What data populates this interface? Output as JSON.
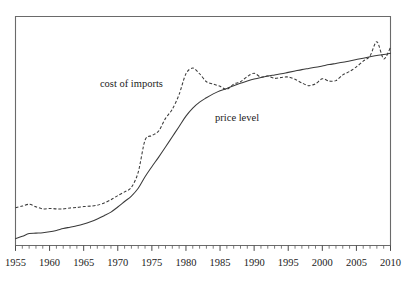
{
  "chart_data": {
    "type": "line",
    "title": "",
    "subtitle": "",
    "xlabel": "",
    "ylabel": "",
    "xlim": [
      1955,
      2010
    ],
    "ylim": [
      0,
      100
    ],
    "grid": false,
    "legend_position": "inline-annotations",
    "x_tick_labels": [
      "1955",
      "1960",
      "1965",
      "1970",
      "1975",
      "1980",
      "1985",
      "1990",
      "1995",
      "2000",
      "2005",
      "2010"
    ],
    "x_tick_values": [
      1955,
      1960,
      1965,
      1970,
      1975,
      1980,
      1985,
      1990,
      1995,
      2000,
      2005,
      2010
    ],
    "x_minor_tick_step": 1,
    "y_axis_visible": false,
    "y_tick_labels": [],
    "annotations": [
      {
        "text": "cost of imports",
        "x": 1972.0,
        "y": 69.0
      },
      {
        "text": "price level",
        "x": 1987.5,
        "y": 54.5
      }
    ],
    "series": [
      {
        "name": "cost of imports",
        "style": "dashed",
        "color": "#3a3a3a",
        "x": [
          1955,
          1956,
          1957,
          1958,
          1959,
          1960,
          1961,
          1962,
          1963,
          1964,
          1965,
          1966,
          1967,
          1968,
          1969,
          1970,
          1971,
          1972,
          1973,
          1974,
          1975,
          1976,
          1977,
          1978,
          1979,
          1980,
          1981,
          1982,
          1983,
          1984,
          1985,
          1986,
          1987,
          1988,
          1989,
          1990,
          1991,
          1992,
          1993,
          1994,
          1995,
          1996,
          1997,
          1998,
          1999,
          2000,
          2001,
          2002,
          2003,
          2004,
          2005,
          2006,
          2007,
          2008,
          2009,
          2010
        ],
        "y": [
          16.5,
          17.2,
          18.0,
          16.9,
          16.0,
          16.2,
          16.0,
          16.0,
          16.4,
          16.6,
          17.0,
          17.2,
          17.6,
          18.6,
          20.0,
          21.8,
          23.4,
          25.4,
          32.0,
          46.0,
          48.0,
          50.0,
          55.5,
          59.5,
          66.0,
          75.0,
          77.5,
          75.0,
          71.5,
          70.5,
          69.5,
          68.2,
          70.5,
          71.5,
          73.8,
          75.2,
          73.5,
          74.0,
          73.0,
          73.4,
          73.6,
          72.6,
          71.0,
          69.8,
          70.6,
          72.8,
          71.8,
          72.0,
          74.5,
          76.0,
          78.0,
          80.5,
          82.8,
          89.0,
          81.5,
          86.5
        ]
      },
      {
        "name": "price level",
        "style": "solid",
        "color": "#3a3a3a",
        "x": [
          1955,
          1956,
          1957,
          1958,
          1959,
          1960,
          1961,
          1962,
          1963,
          1964,
          1965,
          1966,
          1967,
          1968,
          1969,
          1970,
          1971,
          1972,
          1973,
          1974,
          1975,
          1976,
          1977,
          1978,
          1979,
          1980,
          1981,
          1982,
          1983,
          1984,
          1985,
          1986,
          1987,
          1988,
          1989,
          1990,
          1991,
          1992,
          1993,
          1994,
          1995,
          1996,
          1997,
          1998,
          1999,
          2000,
          2001,
          2002,
          2003,
          2004,
          2005,
          2006,
          2007,
          2008,
          2009,
          2010
        ],
        "y": [
          3.0,
          4.0,
          5.2,
          5.4,
          5.6,
          6.0,
          6.6,
          7.4,
          8.0,
          8.6,
          9.4,
          10.4,
          11.6,
          13.0,
          14.6,
          16.8,
          19.2,
          21.6,
          25.0,
          30.0,
          34.4,
          38.6,
          43.0,
          47.5,
          52.0,
          56.5,
          60.0,
          62.6,
          64.5,
          66.2,
          67.6,
          68.6,
          69.8,
          70.8,
          71.8,
          72.7,
          73.4,
          74.0,
          74.5,
          75.0,
          75.6,
          76.2,
          76.8,
          77.3,
          77.8,
          78.4,
          79.0,
          79.5,
          80.0,
          80.6,
          81.2,
          81.8,
          82.4,
          83.0,
          83.4,
          84.0
        ]
      }
    ]
  }
}
